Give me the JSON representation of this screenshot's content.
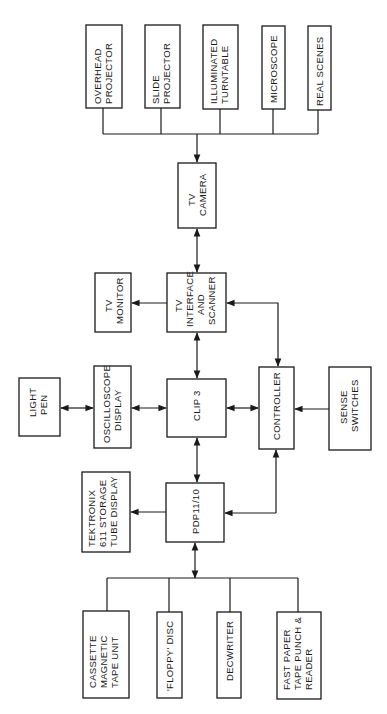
{
  "header": {
    "clipped_text": ""
  },
  "diagram": {
    "title": "",
    "orientation": "rotated-90-ccw",
    "nodes": {
      "overhead_projector": [
        "OVERHEAD",
        "PROJECTOR"
      ],
      "slide_projector": [
        "SLIDE",
        "PROJECTOR"
      ],
      "illuminated_turntable": [
        "ILLUMINATED",
        "TURNTABLE"
      ],
      "microscope": [
        "MICROSCOPE"
      ],
      "real_scenes": [
        "REAL  SCENES"
      ],
      "tv_camera": [
        "TV",
        "CAMERA"
      ],
      "tv_monitor": [
        "TV",
        "MONITOR"
      ],
      "tv_interface": [
        "TV",
        "INTERFACE",
        "AND",
        "SCANNER"
      ],
      "light_pen": [
        "LIGHT",
        "PEN"
      ],
      "oscilloscope_display": [
        "OSCILLOSCOPE",
        "DISPLAY"
      ],
      "clip3": [
        "CLIP  3"
      ],
      "controller": [
        "CONTROLLER"
      ],
      "sense_switches": [
        "SENSE",
        "SWITCHES"
      ],
      "tektronix": [
        "TEKTRONIX",
        "611  STORAGE",
        "TUBE  DISPLAY"
      ],
      "pdp": [
        "PDP11/10"
      ],
      "cassette": [
        "CASSETTE",
        "MAGNETIC",
        "TAPE  UNIT"
      ],
      "floppy": [
        "'FLOPPY' DISC"
      ],
      "decwriter": [
        "DECWRITER"
      ],
      "fast_paper": [
        "FAST  PAPER",
        "TAPE  PUNCH &",
        "READER"
      ]
    },
    "connections": [
      {
        "from": "input_devices_bus",
        "to": "tv_camera",
        "type": "one-way"
      },
      {
        "from": "tv_camera",
        "to": "tv_interface",
        "type": "two-way"
      },
      {
        "from": "tv_interface",
        "to": "tv_monitor",
        "type": "one-way"
      },
      {
        "from": "tv_interface",
        "to": "clip3",
        "type": "two-way"
      },
      {
        "from": "tv_interface",
        "to": "controller",
        "type": "two-way"
      },
      {
        "from": "light_pen",
        "to": "oscilloscope_display",
        "type": "two-way"
      },
      {
        "from": "oscilloscope_display",
        "to": "clip3",
        "type": "two-way"
      },
      {
        "from": "clip3",
        "to": "controller",
        "type": "two-way"
      },
      {
        "from": "sense_switches",
        "to": "controller",
        "type": "one-way"
      },
      {
        "from": "clip3",
        "to": "pdp",
        "type": "two-way"
      },
      {
        "from": "pdp",
        "to": "tektronix",
        "type": "one-way"
      },
      {
        "from": "pdp",
        "to": "controller",
        "type": "one-way"
      },
      {
        "from": "pdp",
        "to": "peripherals_bus",
        "type": "two-way"
      }
    ],
    "colors": {
      "line": "#1a1a1a",
      "background": "#ffffff"
    }
  }
}
